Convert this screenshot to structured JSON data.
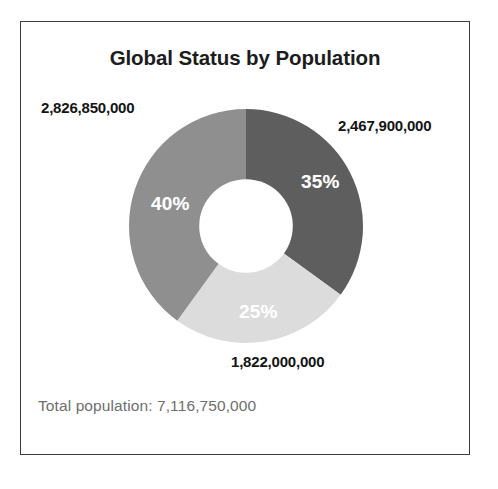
{
  "card": {
    "title": "Global Status by Population",
    "footer_text": "Total population: 7,116,750,000",
    "border_color": "#3c3c3c",
    "background_color": "#ffffff"
  },
  "chart_data": {
    "type": "pie",
    "variant": "donut",
    "title": "Global Status by Population",
    "subtitle": "",
    "xlabel": "",
    "ylabel": "",
    "legend_position": "none",
    "grid": false,
    "start_angle_deg": 0,
    "direction": "clockwise",
    "inner_radius_ratio": 0.4,
    "total_label": "Total population: 7,116,750,000",
    "total_value": 7116750000,
    "categories": [
      "2,467,900,000",
      "1,822,000,000",
      "2,826,850,000"
    ],
    "values": [
      2467900000,
      1822000000,
      2826850000
    ],
    "percent_labels": [
      "35%",
      "25%",
      "40%"
    ],
    "percents": [
      35,
      25,
      40
    ],
    "colors": [
      "#5e5e5e",
      "#dcdcdc",
      "#8f8f8f"
    ],
    "slices": [
      {
        "value_label": "2,467,900,000",
        "value": 2467900000,
        "percent_label": "35%",
        "percent": 35,
        "color": "#5e5e5e",
        "label_color": "#ffffff"
      },
      {
        "value_label": "1,822,000,000",
        "value": 1822000000,
        "percent_label": "25%",
        "percent": 25,
        "color": "#dcdcdc",
        "label_color": "#ffffff"
      },
      {
        "value_label": "2,826,850,000",
        "value": 2826850000,
        "percent_label": "40%",
        "percent": 40,
        "color": "#8f8f8f",
        "label_color": "#ffffff"
      }
    ]
  }
}
